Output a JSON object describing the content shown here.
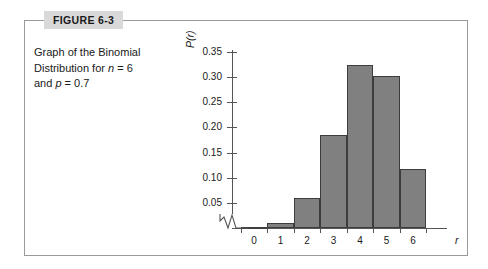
{
  "figure": {
    "tab_label": "FIGURE 6-3",
    "caption_line1": "Graph of the Binomial",
    "caption_line2_pre": "Distribution for ",
    "caption_n": "n",
    "caption_line2_mid": " = 6",
    "caption_line3_pre": "and ",
    "caption_p": "p",
    "caption_line3_post": " = 0.7",
    "border_color": "#9a9a9a",
    "tab_background": "#d9d9d9"
  },
  "chart_data": {
    "type": "bar",
    "title": "Graph of the Binomial Distribution for n = 6 and p = 0.7",
    "xlabel": "r",
    "ylabel": "P(r)",
    "categories": [
      "0",
      "1",
      "2",
      "3",
      "4",
      "5",
      "6"
    ],
    "values": [
      0.001,
      0.01,
      0.06,
      0.185,
      0.324,
      0.303,
      0.118
    ],
    "ylim": [
      0,
      0.35
    ],
    "xlim": [
      -0.5,
      6.5
    ],
    "ytick_labels": [
      "0.05",
      "0.10",
      "0.15",
      "0.20",
      "0.25",
      "0.30",
      "0.35"
    ],
    "ytick_values": [
      0.05,
      0.1,
      0.15,
      0.2,
      0.25,
      0.3,
      0.35
    ],
    "grid": false,
    "legend": false,
    "axis_break": true,
    "bar_fill_color": "#808080",
    "bar_edge_color": "#3d3d3d",
    "axis_color": "#555555"
  }
}
